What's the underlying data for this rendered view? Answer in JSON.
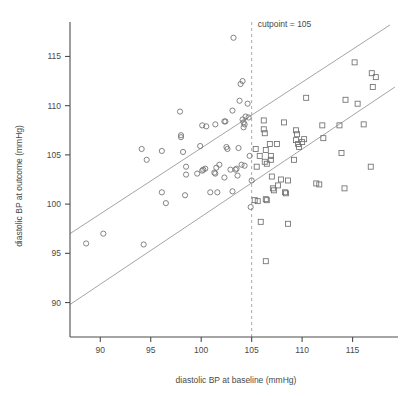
{
  "chart_data": {
    "type": "scatter",
    "title": "",
    "xlabel": "diastolic BP at baseline (mmHg)",
    "ylabel": "diastolic BP at outcome (mmHg)",
    "xlim": [
      87.0,
      119.5
    ],
    "ylim": [
      86.5,
      118.5
    ],
    "xticks": [
      90,
      95,
      100,
      105,
      110,
      115
    ],
    "yticks": [
      90,
      95,
      100,
      105,
      110,
      115
    ],
    "xtick_labels": [
      "90",
      "95",
      "100",
      "105",
      "110",
      "115"
    ],
    "ytick_labels": [
      "90",
      "95",
      "100",
      "105",
      "110",
      "115"
    ],
    "grid": false,
    "legend": "none",
    "annotations": [
      {
        "name": "cutpoint-label",
        "text": "cutpoint = 105",
        "x": 105.3,
        "y": 118.0
      }
    ],
    "reference_lines": [
      {
        "name": "cutpoint-vline",
        "orientation": "vertical",
        "value": 105,
        "style": "dashed",
        "color": "#a0a0a0"
      }
    ],
    "fit_lines": [
      {
        "name": "upper-fit-line",
        "x_start": 87.0,
        "y_start": 97.0,
        "x_end": 118.7,
        "y_end": 118.2,
        "color": "#9a9a9a"
      },
      {
        "name": "lower-fit-line",
        "x_start": 87.0,
        "y_start": 89.8,
        "x_end": 119.2,
        "y_end": 111.9,
        "color": "#9a9a9a"
      }
    ],
    "series": [
      {
        "name": "baseline below cutpoint",
        "marker": "circle",
        "color": "#6f6f6f",
        "points": [
          [
            88.6,
            96.0
          ],
          [
            90.3,
            97.0
          ],
          [
            94.3,
            95.9
          ],
          [
            94.1,
            105.6
          ],
          [
            94.6,
            104.5
          ],
          [
            96.1,
            105.4
          ],
          [
            96.1,
            101.2
          ],
          [
            96.5,
            100.1
          ],
          [
            97.9,
            109.4
          ],
          [
            98.0,
            107.0
          ],
          [
            98.0,
            106.8
          ],
          [
            98.2,
            105.3
          ],
          [
            98.5,
            103.8
          ],
          [
            98.5,
            103.0
          ],
          [
            98.4,
            100.9
          ],
          [
            100.1,
            108.0
          ],
          [
            100.5,
            107.9
          ],
          [
            100.4,
            103.6
          ],
          [
            100.2,
            103.5
          ],
          [
            100.1,
            103.4
          ],
          [
            99.9,
            105.9
          ],
          [
            101.4,
            108.1
          ],
          [
            101.5,
            103.7
          ],
          [
            101.3,
            103.2
          ],
          [
            101.4,
            103.1
          ],
          [
            101.6,
            101.2
          ],
          [
            101.8,
            104.0
          ],
          [
            102.4,
            108.4
          ],
          [
            102.3,
            108.4
          ],
          [
            102.5,
            105.8
          ],
          [
            102.6,
            105.6
          ],
          [
            102.3,
            102.7
          ],
          [
            102.9,
            103.5
          ],
          [
            103.2,
            116.9
          ],
          [
            103.1,
            109.5
          ],
          [
            103.5,
            103.6
          ],
          [
            103.4,
            103.5
          ],
          [
            103.6,
            102.9
          ],
          [
            103.7,
            105.7
          ],
          [
            103.9,
            112.2
          ],
          [
            104.1,
            112.5
          ],
          [
            103.8,
            110.5
          ],
          [
            104.1,
            108.6
          ],
          [
            104.2,
            108.3
          ],
          [
            104.3,
            108.1
          ],
          [
            104.2,
            107.8
          ],
          [
            104.4,
            108.9
          ],
          [
            104.6,
            110.2
          ],
          [
            104.7,
            108.8
          ],
          [
            104.8,
            104.9
          ],
          [
            105.0,
            102.4
          ],
          [
            104.9,
            99.7
          ],
          [
            103.1,
            101.3
          ],
          [
            100.9,
            101.2
          ],
          [
            99.6,
            103.1
          ],
          [
            104.0,
            104.0
          ],
          [
            104.3,
            103.9
          ]
        ]
      },
      {
        "name": "baseline above cutpoint",
        "marker": "square",
        "color": "#6f6f6f",
        "points": [
          [
            105.4,
            105.6
          ],
          [
            105.5,
            103.8
          ],
          [
            105.3,
            100.4
          ],
          [
            105.6,
            100.3
          ],
          [
            105.9,
            98.2
          ],
          [
            106.2,
            108.5
          ],
          [
            106.2,
            107.6
          ],
          [
            106.3,
            107.2
          ],
          [
            106.4,
            105.5
          ],
          [
            106.3,
            104.3
          ],
          [
            106.5,
            104.1
          ],
          [
            106.4,
            100.5
          ],
          [
            106.5,
            100.4
          ],
          [
            106.4,
            94.2
          ],
          [
            106.8,
            106.1
          ],
          [
            106.9,
            104.9
          ],
          [
            106.9,
            104.5
          ],
          [
            107.0,
            102.8
          ],
          [
            107.1,
            101.6
          ],
          [
            107.2,
            101.4
          ],
          [
            107.5,
            106.1
          ],
          [
            107.6,
            101.9
          ],
          [
            107.9,
            102.5
          ],
          [
            108.2,
            108.3
          ],
          [
            108.3,
            101.2
          ],
          [
            108.4,
            101.1
          ],
          [
            108.6,
            98.0
          ],
          [
            109.2,
            104.5
          ],
          [
            109.4,
            107.5
          ],
          [
            109.5,
            107.1
          ],
          [
            109.4,
            106.5
          ],
          [
            109.6,
            106.1
          ],
          [
            109.7,
            105.8
          ],
          [
            110.0,
            106.3
          ],
          [
            110.4,
            110.8
          ],
          [
            110.2,
            106.6
          ],
          [
            111.4,
            102.1
          ],
          [
            111.7,
            102.0
          ],
          [
            112.1,
            106.7
          ],
          [
            112.0,
            108.0
          ],
          [
            113.7,
            108.0
          ],
          [
            113.9,
            105.2
          ],
          [
            114.2,
            101.6
          ],
          [
            114.3,
            110.6
          ],
          [
            115.2,
            114.4
          ],
          [
            115.5,
            110.2
          ],
          [
            116.1,
            108.1
          ],
          [
            116.9,
            113.3
          ],
          [
            117.3,
            112.9
          ],
          [
            117.0,
            111.9
          ],
          [
            116.8,
            103.8
          ],
          [
            105.8,
            104.9
          ],
          [
            108.6,
            102.4
          ]
        ]
      }
    ]
  }
}
